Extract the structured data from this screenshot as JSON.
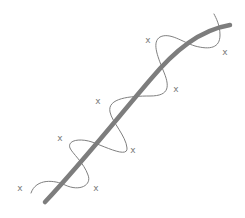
{
  "diagram": {
    "colors": {
      "background": "#ffffff",
      "smooth_curve": "#7d7d7d",
      "wiggly_curve": "#808080",
      "markers": "#7a7a7a"
    },
    "smooth_curve_path": "M 45 202 C 80 165, 120 115, 150 80 C 175 50, 200 30, 230 25",
    "wiggly_curve_path": "M 31 193 C 36 178, 55 180, 65 185 C 80 192, 92 185, 88 175 C 84 163, 72 153, 70 148 C 67 140, 80 138, 92 142 C 108 148, 128 158, 127 148 C 126 136, 112 122, 110 112 C 107 98, 130 96, 150 96 C 170 96, 170 86, 163 70 C 157 55, 152 42, 160 37 C 170 32, 182 42, 195 46 C 210 50, 220 48, 220 35 C 220 25, 216 18, 214 14",
    "markers": [
      {
        "label": "x",
        "x": 20,
        "y": 188
      },
      {
        "label": "x",
        "x": 96,
        "y": 188
      },
      {
        "label": "x",
        "x": 60,
        "y": 138
      },
      {
        "label": "x",
        "x": 133,
        "y": 150
      },
      {
        "label": "x",
        "x": 98,
        "y": 101
      },
      {
        "label": "x",
        "x": 176,
        "y": 89
      },
      {
        "label": "x",
        "x": 148,
        "y": 40
      },
      {
        "label": "x",
        "x": 225,
        "y": 52
      }
    ]
  }
}
